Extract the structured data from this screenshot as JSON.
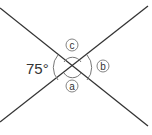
{
  "diagram": {
    "type": "intersecting-lines-angles",
    "angle_label": "75°",
    "markers": {
      "a": "a",
      "b": "b",
      "c": "c"
    },
    "colors": {
      "line": "#333333",
      "arc": "#777777",
      "background": "#ffffff"
    }
  }
}
